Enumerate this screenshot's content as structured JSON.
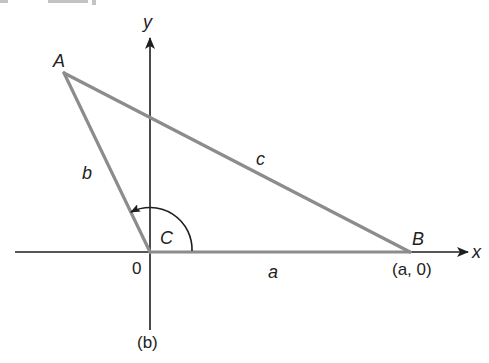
{
  "figure": {
    "caption": "(b)",
    "axes": {
      "x_label": "x",
      "y_label": "y",
      "origin_label": "0"
    },
    "vertices": {
      "A": {
        "label": "A"
      },
      "B": {
        "label": "B",
        "coord_label": "(a, 0)"
      },
      "C": {
        "label": "C"
      }
    },
    "sides": {
      "a": "a",
      "b": "b",
      "c": "c"
    },
    "colors": {
      "axis": "#1e1e1e",
      "triangle": "#8c8c8c"
    }
  }
}
